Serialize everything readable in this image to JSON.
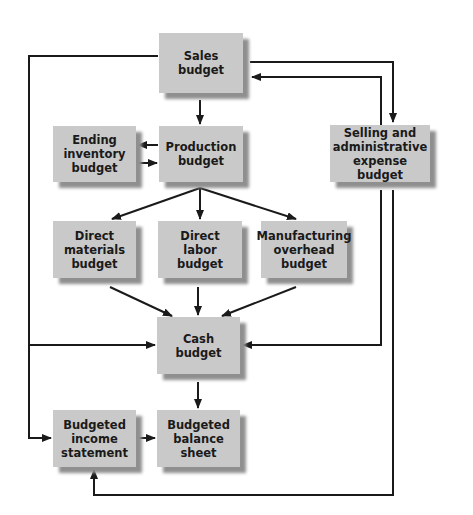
{
  "diagram": {
    "nodes": [
      {
        "id": "sales",
        "label": "Sales\nbudget"
      },
      {
        "id": "ending_inventory",
        "label": "Ending\ninventory\nbudget"
      },
      {
        "id": "production",
        "label": "Production\nbudget"
      },
      {
        "id": "selling_admin",
        "label": "Selling and\nadministrative\nexpense budget"
      },
      {
        "id": "direct_materials",
        "label": "Direct\nmaterials\nbudget"
      },
      {
        "id": "direct_labor",
        "label": "Direct\nlabor\nbudget"
      },
      {
        "id": "mfg_overhead",
        "label": "Manufacturing\noverhead\nbudget"
      },
      {
        "id": "cash",
        "label": "Cash\nbudget"
      },
      {
        "id": "budgeted_income",
        "label": "Budgeted\nincome\nstatement"
      },
      {
        "id": "budgeted_balance",
        "label": "Budgeted\nbalance\nsheet"
      }
    ],
    "edges": [
      {
        "from": "sales",
        "to": "production"
      },
      {
        "from": "sales",
        "to": "selling_admin"
      },
      {
        "from": "selling_admin",
        "to": "sales"
      },
      {
        "from": "production",
        "to": "ending_inventory"
      },
      {
        "from": "ending_inventory",
        "to": "production"
      },
      {
        "from": "production",
        "to": "direct_materials"
      },
      {
        "from": "production",
        "to": "direct_labor"
      },
      {
        "from": "production",
        "to": "mfg_overhead"
      },
      {
        "from": "direct_materials",
        "to": "cash"
      },
      {
        "from": "direct_labor",
        "to": "cash"
      },
      {
        "from": "mfg_overhead",
        "to": "cash"
      },
      {
        "from": "sales",
        "to": "cash"
      },
      {
        "from": "selling_admin",
        "to": "cash"
      },
      {
        "from": "cash",
        "to": "budgeted_balance"
      },
      {
        "from": "sales",
        "to": "budgeted_income"
      },
      {
        "from": "budgeted_income",
        "to": "budgeted_balance"
      },
      {
        "from": "selling_admin",
        "to": "budgeted_income"
      }
    ],
    "colors": {
      "box_fill": "#c9c9c9",
      "box_shadow": "#8f8f8f",
      "line": "#1a1a1a",
      "text": "#1a1a1a"
    }
  }
}
